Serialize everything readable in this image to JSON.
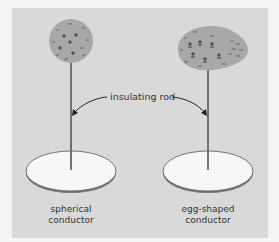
{
  "figure": {
    "left": {
      "name": "spherical conductor",
      "caption_line1": "spherical",
      "caption_line2": "conductor",
      "shape": "sphere",
      "charges": [
        "+",
        "+",
        "+",
        "+",
        "+",
        "-",
        "-",
        "-",
        "-",
        "-",
        "-",
        "-",
        "-",
        "-"
      ]
    },
    "right": {
      "name": "egg-shaped conductor",
      "caption_line1": "egg-shaped",
      "caption_line2": "conductor",
      "shape": "egg",
      "charges": [
        "±",
        "±",
        "±",
        "±",
        "±",
        "±",
        "-",
        "-",
        "-",
        "-",
        "-",
        "-",
        "-",
        "-",
        "-",
        "-",
        "-",
        "-",
        "-"
      ]
    },
    "shared_label": "insulating rod",
    "colors": {
      "background": "#f4f4f4",
      "panel": "#d9d9d9",
      "conductor_fill": "#a8a8a8",
      "plate_fill": "#f7f7f7",
      "rod": "#666666",
      "ink": "#333333"
    }
  }
}
